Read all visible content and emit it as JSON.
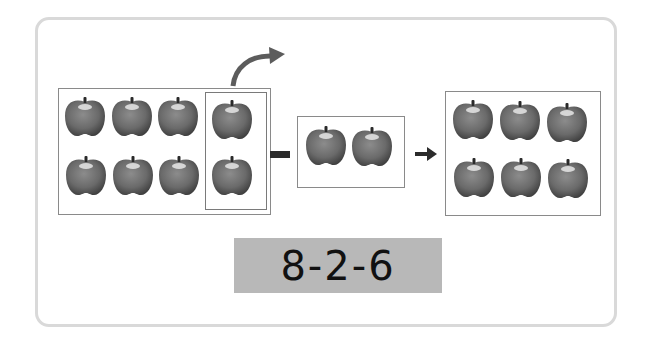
{
  "figure": {
    "groups": {
      "start": {
        "count": 8,
        "rows": 2,
        "cols": 4,
        "highlighted_removed": 2
      },
      "removed": {
        "count": 2
      },
      "result": {
        "count": 6,
        "rows": 2,
        "cols": 3
      }
    },
    "operators": {
      "minus": "minus-sign",
      "arrow": "right-arrow",
      "move_arrow": "curved-arrow"
    },
    "equation": "8-2-6",
    "colors": {
      "apple": "#6f6f6f",
      "equation_bg": "#b8b8b8",
      "frame_border": "#d9d9d9"
    }
  }
}
